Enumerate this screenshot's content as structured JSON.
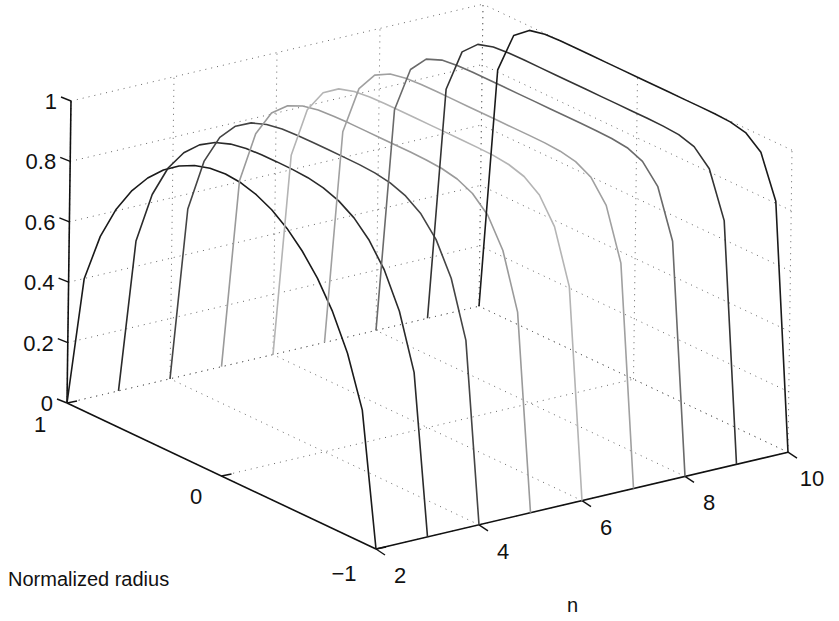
{
  "chart_data": {
    "type": "line3d",
    "title": "",
    "xlabel": "n",
    "ylabel": "Normalized radius",
    "zlabel": "",
    "x_ticks": [
      "2",
      "4",
      "6",
      "8",
      "10"
    ],
    "y_ticks": [
      "1",
      "0",
      "−1"
    ],
    "z_ticks": [
      "0",
      "0.2",
      "0.4",
      "0.6",
      "0.8",
      "1"
    ],
    "xlim": [
      2,
      10
    ],
    "ylim": [
      -1,
      1
    ],
    "zlim": [
      0,
      1
    ],
    "grid": true,
    "series_description": "Flat-top radial profiles z = sqrt(1 - |r|^n) for each integer n",
    "series": [
      {
        "name": "n=2",
        "n": 2,
        "color": "#1a1a1a"
      },
      {
        "name": "n=3",
        "n": 3,
        "color": "#2a2a2a"
      },
      {
        "name": "n=4",
        "n": 4,
        "color": "#444444"
      },
      {
        "name": "n=5",
        "n": 5,
        "color": "#9a9a9a"
      },
      {
        "name": "n=6",
        "n": 6,
        "color": "#b4b4b4"
      },
      {
        "name": "n=7",
        "n": 7,
        "color": "#a0a0a0"
      },
      {
        "name": "n=8",
        "n": 8,
        "color": "#6a6a6a"
      },
      {
        "name": "n=9",
        "n": 9,
        "color": "#333333"
      },
      {
        "name": "n=10",
        "n": 10,
        "color": "#1a1a1a"
      }
    ]
  }
}
